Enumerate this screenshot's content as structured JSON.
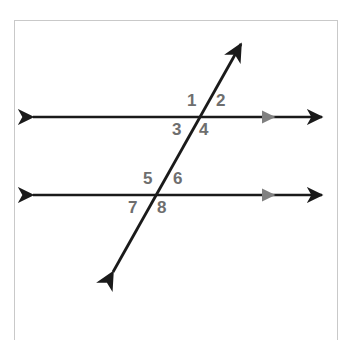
{
  "figure": {
    "background_color": "#ffffff",
    "frame": {
      "name": "figure-border",
      "color": "#c9c9c9",
      "x": 14,
      "y": 20,
      "width": 324,
      "height": 320
    },
    "line_color": "#1a1a1a",
    "marker_color": "#808080",
    "label_color": "#6e6e6e",
    "lines": [
      {
        "id": "parallel-line-top",
        "role": "parallel-line",
        "x1": 33,
        "y1": 117,
        "x2": 322,
        "y2": 117,
        "arrowheads": "both",
        "parallel_marker": "single-chevron-right"
      },
      {
        "id": "parallel-line-bottom",
        "role": "parallel-line",
        "x1": 33,
        "y1": 195,
        "x2": 322,
        "y2": 195,
        "arrowheads": "both",
        "parallel_marker": "single-chevron-right"
      },
      {
        "id": "transversal-line",
        "role": "transversal",
        "x1": 113,
        "y1": 272,
        "x2": 241,
        "y2": 44,
        "arrowheads": "both",
        "parallel_marker": "none"
      }
    ],
    "intersections": [
      {
        "id": "intersection-top",
        "x": 199,
        "y": 117
      },
      {
        "id": "intersection-bottom",
        "x": 156,
        "y": 195
      }
    ],
    "angle_labels": [
      {
        "id": "angle-1",
        "text": "1",
        "x": 187,
        "y": 92,
        "position": "top-left",
        "intersection": "intersection-top"
      },
      {
        "id": "angle-2",
        "text": "2",
        "x": 216,
        "y": 92,
        "position": "top-right",
        "intersection": "intersection-top"
      },
      {
        "id": "angle-3",
        "text": "3",
        "x": 172,
        "y": 121,
        "position": "bottom-left",
        "intersection": "intersection-top"
      },
      {
        "id": "angle-4",
        "text": "4",
        "x": 199,
        "y": 121,
        "position": "bottom-right",
        "intersection": "intersection-top"
      },
      {
        "id": "angle-5",
        "text": "5",
        "x": 143,
        "y": 170,
        "position": "top-left",
        "intersection": "intersection-bottom"
      },
      {
        "id": "angle-6",
        "text": "6",
        "x": 173,
        "y": 170,
        "position": "top-right",
        "intersection": "intersection-bottom"
      },
      {
        "id": "angle-7",
        "text": "7",
        "x": 128,
        "y": 199,
        "position": "bottom-left",
        "intersection": "intersection-bottom"
      },
      {
        "id": "angle-8",
        "text": "8",
        "x": 157,
        "y": 199,
        "position": "bottom-right",
        "intersection": "intersection-bottom"
      }
    ]
  }
}
